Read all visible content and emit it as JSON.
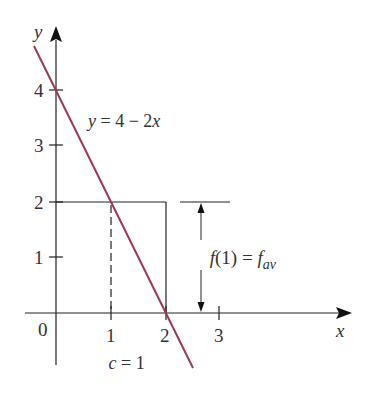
{
  "diagram": {
    "axes": {
      "x_label": "x",
      "y_label": "y",
      "origin_label": "0",
      "x_ticks": [
        "1",
        "2",
        "3"
      ],
      "y_ticks": [
        "1",
        "2",
        "3",
        "4"
      ]
    },
    "line": {
      "equation_label": "y = 4 − 2x",
      "eq_y": "y",
      "eq_rest": " = 4 − 2",
      "eq_x": "x",
      "color": "#9b3a52"
    },
    "rectangle": {
      "x_from": 0,
      "x_to": 2,
      "height": 2
    },
    "dashed_line": {
      "x": 1,
      "y_from": 0,
      "y_to": 2
    },
    "dimension": {
      "label_f": "f",
      "label_arg": "(1) = ",
      "label_fav_f": "f",
      "label_fav_sub": "av"
    },
    "c_label": {
      "c": "c",
      "rest": " = 1"
    },
    "colors": {
      "axis": "#222222",
      "curve": "#9b3a52",
      "text": "#333333"
    }
  }
}
